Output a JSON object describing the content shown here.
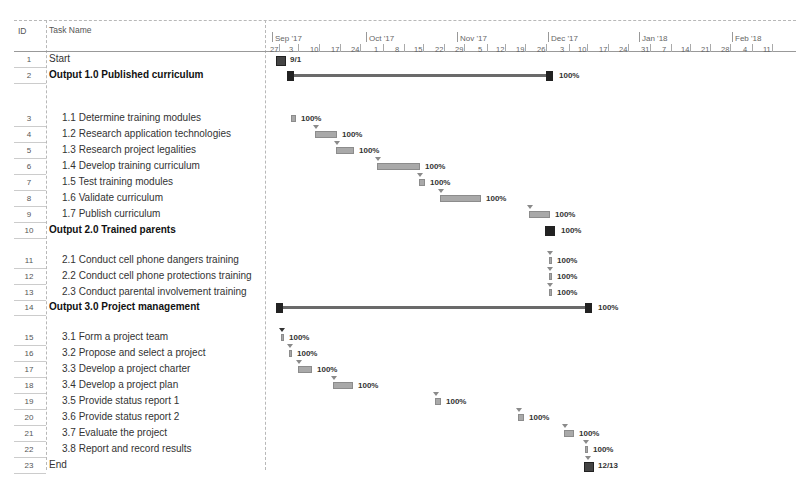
{
  "header": {
    "id_label": "ID",
    "name_label": "Task Name"
  },
  "timeline": {
    "months": [
      {
        "label": "Sep '17",
        "x": 275
      },
      {
        "label": "Oct '17",
        "x": 369
      },
      {
        "label": "Nov '17",
        "x": 460
      },
      {
        "label": "Dec '17",
        "x": 551
      },
      {
        "label": "Jan '18",
        "x": 642
      },
      {
        "label": "Feb '18",
        "x": 735
      }
    ],
    "weeks": [
      {
        "label": "27",
        "x": 270
      },
      {
        "label": "3",
        "x": 289
      },
      {
        "label": "10",
        "x": 310
      },
      {
        "label": "17",
        "x": 331
      },
      {
        "label": "24",
        "x": 351
      },
      {
        "label": "1",
        "x": 374
      },
      {
        "label": "8",
        "x": 395
      },
      {
        "label": "15",
        "x": 414
      },
      {
        "label": "22",
        "x": 435
      },
      {
        "label": "29",
        "x": 455
      },
      {
        "label": "5",
        "x": 478
      },
      {
        "label": "12",
        "x": 496
      },
      {
        "label": "19",
        "x": 516
      },
      {
        "label": "26",
        "x": 537
      },
      {
        "label": "3",
        "x": 560
      },
      {
        "label": "10",
        "x": 578
      },
      {
        "label": "17",
        "x": 599
      },
      {
        "label": "24",
        "x": 619
      },
      {
        "label": "31",
        "x": 641
      },
      {
        "label": "7",
        "x": 662
      },
      {
        "label": "14",
        "x": 681
      },
      {
        "label": "21",
        "x": 701
      },
      {
        "label": "28",
        "x": 721
      },
      {
        "label": "4",
        "x": 743
      },
      {
        "label": "11",
        "x": 763
      }
    ]
  },
  "tasks": [
    {
      "id": "1",
      "name": "Start",
      "summary": false,
      "indent": 0,
      "y": 58,
      "type": "milestone",
      "start": 276,
      "end": 284,
      "label": "9/1"
    },
    {
      "id": "2",
      "name": "Output 1.0 Published curriculum",
      "summary": true,
      "indent": 0,
      "y": 74,
      "type": "summary",
      "start": 287,
      "end": 553,
      "label": "100%"
    },
    {
      "id": "3",
      "name": "1.1 Determine training modules",
      "summary": false,
      "indent": 1,
      "y": 117,
      "type": "task",
      "start": 291,
      "end": 296,
      "label": "100%"
    },
    {
      "id": "4",
      "name": "1.2 Research application technologies",
      "summary": false,
      "indent": 1,
      "y": 133,
      "type": "task",
      "start": 315,
      "end": 337,
      "label": "100%"
    },
    {
      "id": "5",
      "name": "1.3 Research project legalities",
      "summary": false,
      "indent": 1,
      "y": 149,
      "type": "task",
      "start": 336,
      "end": 354,
      "label": "100%"
    },
    {
      "id": "6",
      "name": "1.4 Develop training curriculum",
      "summary": false,
      "indent": 1,
      "y": 165,
      "type": "task",
      "start": 377,
      "end": 420,
      "label": "100%"
    },
    {
      "id": "7",
      "name": "1.5 Test training modules",
      "summary": false,
      "indent": 1,
      "y": 181,
      "type": "task",
      "start": 419,
      "end": 425,
      "label": "100%"
    },
    {
      "id": "8",
      "name": "1.6 Validate curriculum",
      "summary": false,
      "indent": 1,
      "y": 197,
      "type": "task",
      "start": 440,
      "end": 481,
      "label": "100%"
    },
    {
      "id": "9",
      "name": "1.7 Publish curriculum",
      "summary": false,
      "indent": 1,
      "y": 213,
      "type": "task",
      "start": 529,
      "end": 550,
      "label": "100%"
    },
    {
      "id": "10",
      "name": "Output 2.0 Trained parents",
      "summary": true,
      "indent": 0,
      "y": 229,
      "type": "summary-short",
      "start": 545,
      "end": 555,
      "label": "100%"
    },
    {
      "id": "11",
      "name": "2.1 Conduct cell phone dangers training",
      "summary": false,
      "indent": 1,
      "y": 259,
      "type": "task",
      "start": 549,
      "end": 552,
      "label": "100%"
    },
    {
      "id": "12",
      "name": "2.2 Conduct cell phone protections training",
      "summary": false,
      "indent": 1,
      "y": 275,
      "type": "task",
      "start": 549,
      "end": 552,
      "label": "100%"
    },
    {
      "id": "13",
      "name": "2.3 Conduct parental involvement training",
      "summary": false,
      "indent": 1,
      "y": 291,
      "type": "task",
      "start": 549,
      "end": 552,
      "label": "100%"
    },
    {
      "id": "14",
      "name": "Output 3.0 Project management",
      "summary": true,
      "indent": 0,
      "y": 306,
      "type": "summary",
      "start": 276,
      "end": 592,
      "label": "100%"
    },
    {
      "id": "15",
      "name": "3.1 Form a project team",
      "summary": false,
      "indent": 1,
      "y": 336,
      "type": "task",
      "start": 281,
      "end": 284,
      "label": "100%"
    },
    {
      "id": "16",
      "name": "3.2 Propose and select a project",
      "summary": false,
      "indent": 1,
      "y": 352,
      "type": "task",
      "start": 289,
      "end": 292,
      "label": "100%"
    },
    {
      "id": "17",
      "name": "3.3 Develop a project charter",
      "summary": false,
      "indent": 1,
      "y": 368,
      "type": "task",
      "start": 298,
      "end": 312,
      "label": "100%"
    },
    {
      "id": "18",
      "name": "3.4 Develop a project plan",
      "summary": false,
      "indent": 1,
      "y": 384,
      "type": "task",
      "start": 333,
      "end": 353,
      "label": "100%"
    },
    {
      "id": "19",
      "name": "3.5 Provide status report 1",
      "summary": false,
      "indent": 1,
      "y": 400,
      "type": "task",
      "start": 435,
      "end": 441,
      "label": "100%"
    },
    {
      "id": "20",
      "name": "3.6 Provide status report 2",
      "summary": false,
      "indent": 1,
      "y": 416,
      "type": "task",
      "start": 518,
      "end": 524,
      "label": "100%"
    },
    {
      "id": "21",
      "name": "3.7 Evaluate the project",
      "summary": false,
      "indent": 1,
      "y": 432,
      "type": "task",
      "start": 564,
      "end": 574,
      "label": "100%"
    },
    {
      "id": "22",
      "name": "3.8 Report and record results",
      "summary": false,
      "indent": 1,
      "y": 448,
      "type": "task",
      "start": 585,
      "end": 588,
      "label": "100%"
    },
    {
      "id": "23",
      "name": "End",
      "summary": false,
      "indent": 0,
      "y": 464,
      "type": "milestone",
      "start": 584,
      "end": 592,
      "label": "12/13"
    }
  ]
}
